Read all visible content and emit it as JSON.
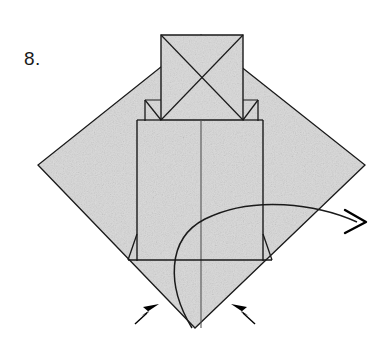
{
  "figure": {
    "step_number": "8.",
    "caption": "",
    "kind": "origami-fold-diagram",
    "background_color": "#ffffff",
    "paper_fill_color": "#d8d8d8",
    "line_color": "#1a1a1a",
    "arrow_color": "#000000"
  },
  "shapes": {
    "outer_diamond": {
      "name": "paper-diamond",
      "points": "201,35 365,165 195,328 38,165"
    },
    "top_square": {
      "name": "top-square-with-x",
      "points": "161,35 243,35 243,120 161,120",
      "diagonals": [
        "161,35 243,120",
        "243,35 161,120"
      ]
    },
    "left_shoulder": {
      "name": "left-shoulder-notch",
      "path": "M145,100 L145,120 M145,100 L161,120"
    },
    "right_shoulder": {
      "name": "right-shoulder-notch",
      "path": "M258,100 L258,120 M258,100 L243,120"
    },
    "center_panel": {
      "name": "center-panel",
      "left_edge": "137,120 137,260",
      "right_edge": "263,120 263,260",
      "top_edge": "137,120 263,120",
      "center_line": "201,120 201,328"
    },
    "horizontal_band": {
      "name": "bottom-horizontal-fold",
      "line": "128,260 272,260"
    },
    "left_flap": {
      "name": "left-bottom-flap",
      "path": "M137,234 L128,260"
    },
    "right_flap": {
      "name": "right-bottom-flap",
      "path": "M263,234 L272,260"
    },
    "curved_arrow": {
      "name": "unfold-curved-arrow",
      "path": "M192,328 C168,286 168,238 205,219 C252,196 316,205 356,222",
      "arrow_tip": "365,222"
    },
    "push_arrow_left": {
      "name": "push-arrow-left",
      "tip": "158,305",
      "tail": "136,323"
    },
    "push_arrow_right": {
      "name": "push-arrow-right",
      "tip": "232,305",
      "tail": "254,323"
    }
  }
}
